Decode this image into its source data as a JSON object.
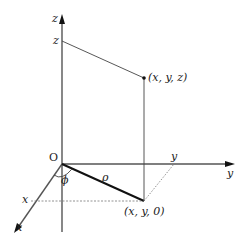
{
  "diagram": {
    "axes": {
      "z_label": "z",
      "y_label": "y",
      "x_label": "x"
    },
    "ticks": {
      "z_tick": "z",
      "y_tick": "y",
      "x_tick": "x"
    },
    "origin_label": "O",
    "point_label": "(x, y, z)",
    "projection_label": "(x, y, 0)",
    "rho_label": "ρ",
    "phi_label": "ϕ"
  }
}
